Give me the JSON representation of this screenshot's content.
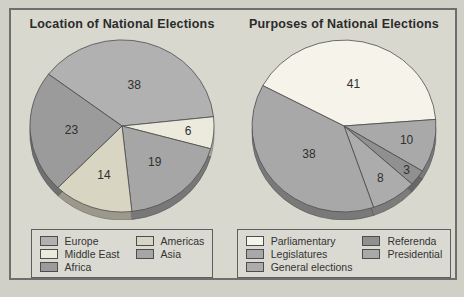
{
  "chart_data": [
    {
      "type": "pie",
      "title": "Location of National Elections",
      "start_angle": -53,
      "effect_3d": true,
      "slices": [
        {
          "label": "Europe",
          "value": 38,
          "color": "#b1b1b1",
          "label_r": 0.5
        },
        {
          "label": "Middle East",
          "value": 6,
          "color": "#eceadd",
          "label_r": 0.72
        },
        {
          "label": "Asia",
          "value": 19,
          "color": "#a6a6a6",
          "label_r": 0.55
        },
        {
          "label": "Americas",
          "value": 14,
          "color": "#d9d5c3",
          "label_r": 0.6
        },
        {
          "label": "Africa",
          "value": 23,
          "color": "#9b9b9b",
          "label_r": 0.55
        }
      ],
      "legend_columns": [
        [
          "Europe",
          "Middle East",
          "Africa"
        ],
        [
          "Americas",
          "Asia"
        ]
      ]
    },
    {
      "type": "pie",
      "title": "Purposes of National Elections",
      "start_angle": -62,
      "effect_3d": true,
      "slices": [
        {
          "label": "Parliamentary",
          "value": 41,
          "color": "#f5f3ea",
          "label_r": 0.5
        },
        {
          "label": "Presidential",
          "value": 10,
          "color": "#a9a9a9",
          "label_r": 0.7
        },
        {
          "label": "Referenda",
          "value": 3,
          "color": "#909090",
          "label_r": 0.85
        },
        {
          "label": "General elections",
          "value": 8,
          "color": "#acacac",
          "label_r": 0.72
        },
        {
          "label": "Legislatures",
          "value": 38,
          "color": "#a8a8a8",
          "label_r": 0.5
        }
      ],
      "legend_columns": [
        [
          "Parliamentary",
          "Legislatures",
          "General elections"
        ],
        [
          "Referenda",
          "Presidential"
        ]
      ]
    }
  ],
  "colors": {
    "page_bg": "#d0d0c7",
    "panel_bg": "#d8d8cf",
    "panel_border": "#6e6e6e",
    "slice_stroke": "#4d4d4d",
    "label_text": "#2f2f2f"
  }
}
